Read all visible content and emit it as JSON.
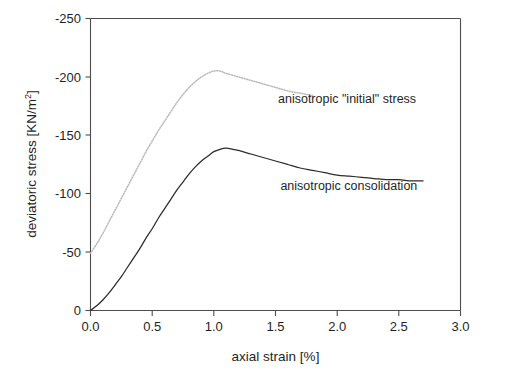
{
  "chart_data": {
    "type": "line",
    "title": "",
    "xlabel": "axial strain [%]",
    "ylabel": "deviatoric stress [KN/m2]",
    "ylabel_text": "deviatoric stress [KN/m",
    "ylabel_sup": "2",
    "ylabel_tail": "]",
    "xlim": [
      0.0,
      3.0
    ],
    "ylim": [
      0,
      -250
    ],
    "grid": false,
    "legend_position": "inline-annotations",
    "xticks": [
      "0.0",
      "0.5",
      "1.0",
      "1.5",
      "2.0",
      "2.5",
      "3.0"
    ],
    "xtick_values": [
      0.0,
      0.5,
      1.0,
      1.5,
      2.0,
      2.5,
      3.0
    ],
    "yticks": [
      "-250",
      "-200",
      "-150",
      "-100",
      "-50",
      "0"
    ],
    "ytick_values": [
      -250,
      -200,
      -150,
      -100,
      -50,
      0
    ],
    "series": [
      {
        "name": "anisotropic \"initial\" stress",
        "style": "dotted",
        "color": "#b9b9b9",
        "x": [
          0.0,
          0.05,
          0.1,
          0.15,
          0.2,
          0.25,
          0.3,
          0.35,
          0.4,
          0.45,
          0.5,
          0.55,
          0.6,
          0.65,
          0.7,
          0.75,
          0.8,
          0.85,
          0.9,
          0.95,
          1.0,
          1.05,
          1.1,
          1.2,
          1.3,
          1.4,
          1.5,
          1.6,
          1.7,
          1.8
        ],
        "y": [
          -49,
          -57,
          -66,
          -76,
          -86,
          -96,
          -106,
          -116,
          -126,
          -136,
          -145,
          -154,
          -162,
          -170,
          -178,
          -185,
          -191,
          -196,
          -200,
          -203,
          -205,
          -205,
          -203,
          -200,
          -197,
          -194,
          -191,
          -188,
          -186,
          -184
        ]
      },
      {
        "name": "anisotropic consolidation",
        "style": "solid",
        "color": "#2b2b2b",
        "x": [
          0.0,
          0.05,
          0.1,
          0.15,
          0.2,
          0.25,
          0.3,
          0.35,
          0.4,
          0.45,
          0.5,
          0.55,
          0.6,
          0.65,
          0.7,
          0.75,
          0.8,
          0.85,
          0.9,
          0.95,
          1.0,
          1.05,
          1.1,
          1.2,
          1.3,
          1.4,
          1.5,
          1.6,
          1.7,
          1.8,
          1.9,
          2.0,
          2.1,
          2.2,
          2.3,
          2.4,
          2.5,
          2.6,
          2.7
        ],
        "y": [
          0,
          -4,
          -9,
          -15,
          -22,
          -29,
          -37,
          -45,
          -53,
          -62,
          -70,
          -79,
          -87,
          -95,
          -103,
          -110,
          -117,
          -123,
          -128,
          -132,
          -136,
          -138,
          -139,
          -137,
          -134,
          -131,
          -128,
          -125,
          -122,
          -120,
          -118,
          -116,
          -115,
          -114,
          -113,
          -112,
          -112,
          -111,
          -111
        ]
      }
    ],
    "annotations": [
      {
        "text": "anisotropic \"initial\" stress",
        "x": 1.52,
        "y": -178,
        "anchor": "start",
        "for_series": "anisotropic \"initial\" stress"
      },
      {
        "text": "anisotropic consolidation",
        "x": 1.54,
        "y": -103,
        "anchor": "start",
        "for_series": "anisotropic consolidation"
      }
    ]
  }
}
